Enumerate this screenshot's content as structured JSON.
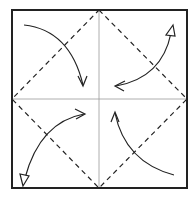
{
  "diagram": {
    "title": "Origami step: fold four corners to center (blintz fold)",
    "paper": {
      "shape": "square",
      "x": 12,
      "y": 10,
      "width": 175,
      "height": 178,
      "stroke": "#222222"
    },
    "center": {
      "x": 99,
      "y": 99
    },
    "creases": [
      {
        "type": "existing-crease",
        "from": [
          12,
          99
        ],
        "to": [
          187,
          99
        ]
      },
      {
        "type": "existing-crease",
        "from": [
          99,
          10
        ],
        "to": [
          99,
          188
        ]
      }
    ],
    "fold_lines": [
      {
        "type": "valley",
        "from": [
          99,
          10
        ],
        "to": [
          187,
          99
        ]
      },
      {
        "type": "valley",
        "from": [
          187,
          99
        ],
        "to": [
          99,
          188
        ]
      },
      {
        "type": "valley",
        "from": [
          99,
          188
        ],
        "to": [
          12,
          99
        ]
      },
      {
        "type": "valley",
        "from": [
          12,
          99
        ],
        "to": [
          99,
          10
        ]
      }
    ],
    "arrows": [
      {
        "name": "fold-top-left-corner",
        "kind": "valley-fold",
        "path": "M24 25 Q70 30 83 85",
        "head": "open",
        "head_tip": [
          83,
          85
        ]
      },
      {
        "name": "fold-top-right-corner",
        "kind": "fold-and-unfold",
        "path": "M171 32 Q160 78 116 86",
        "head": "open",
        "head_tip": [
          116,
          86
        ],
        "tail": "hollow",
        "tail_tip": [
          173,
          27
        ]
      },
      {
        "name": "fold-bottom-left-corner",
        "kind": "fold-and-unfold",
        "path": "M84 114 Q40 122 25 178",
        "head": "open",
        "head_tip": [
          84,
          114
        ],
        "tail": "hollow",
        "tail_tip": [
          23,
          184
        ]
      },
      {
        "name": "fold-bottom-right-corner",
        "kind": "valley-fold",
        "path": "M174 175 Q125 162 115 113",
        "head": "open",
        "head_tip": [
          115,
          113
        ]
      }
    ]
  }
}
